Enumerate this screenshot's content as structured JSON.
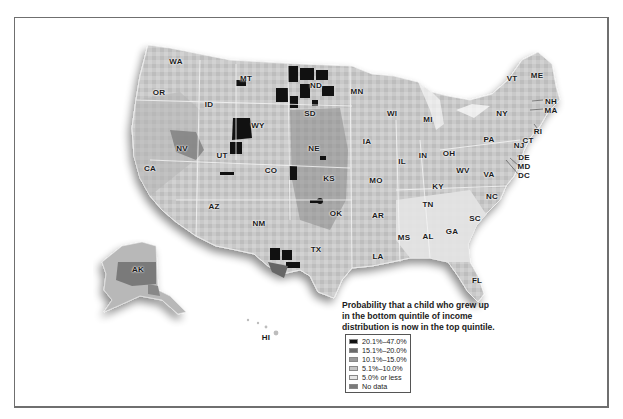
{
  "chart_data": {
    "type": "choropleth-map",
    "title": "Probability that a child who grew up in the bottom quintile of income distribution is now in the top quintile.",
    "legend": [
      {
        "label": "20.1%–47.0%",
        "color": "#111111"
      },
      {
        "label": "15.1%–20.0%",
        "color": "#6b6b6b"
      },
      {
        "label": "10.1%–15.0%",
        "color": "#9a9a9a"
      },
      {
        "label": "5.1%–10.0%",
        "color": "#c4c4c4"
      },
      {
        "label": "5.0% or less",
        "color": "#e6e6e6"
      },
      {
        "label": "No data",
        "color": "#7a7a7a"
      }
    ],
    "states": [
      "WA",
      "OR",
      "CA",
      "NV",
      "ID",
      "MT",
      "WY",
      "UT",
      "CO",
      "AZ",
      "NM",
      "ND",
      "SD",
      "NE",
      "KS",
      "OK",
      "TX",
      "MN",
      "IA",
      "MO",
      "AR",
      "LA",
      "WI",
      "IL",
      "MI",
      "IN",
      "OH",
      "KY",
      "TN",
      "MS",
      "AL",
      "GA",
      "SC",
      "NC",
      "FL",
      "WV",
      "VA",
      "PA",
      "NY",
      "VT",
      "ME",
      "NH",
      "MA",
      "RI",
      "CT",
      "NJ",
      "DE",
      "MD",
      "DC",
      "AK",
      "HI"
    ],
    "highlights": {
      "highest_regions": [
        "ND",
        "SD",
        "MT (east)",
        "WY",
        "UT (north)",
        "NE",
        "KS",
        "OK",
        "TX (west)"
      ],
      "lowest_regions": [
        "Southeast: GA, SC, NC, AL, MS, TN"
      ]
    }
  },
  "map": {
    "caption_lines": [
      "Probability that a child who grew up",
      "in the bottom quintile of income",
      "distribution is now in the top quintile."
    ],
    "labels": [
      {
        "id": "WA",
        "x": 176,
        "y": 61
      },
      {
        "id": "OR",
        "x": 159,
        "y": 92
      },
      {
        "id": "CA",
        "x": 150,
        "y": 168
      },
      {
        "id": "NV",
        "x": 182,
        "y": 148
      },
      {
        "id": "ID",
        "x": 209,
        "y": 104
      },
      {
        "id": "MT",
        "x": 246,
        "y": 78
      },
      {
        "id": "WY",
        "x": 258,
        "y": 125
      },
      {
        "id": "UT",
        "x": 222,
        "y": 155
      },
      {
        "id": "CO",
        "x": 271,
        "y": 170
      },
      {
        "id": "AZ",
        "x": 214,
        "y": 206
      },
      {
        "id": "NM",
        "x": 259,
        "y": 223
      },
      {
        "id": "ND",
        "x": 316,
        "y": 85
      },
      {
        "id": "SD",
        "x": 310,
        "y": 113
      },
      {
        "id": "NE",
        "x": 314,
        "y": 148
      },
      {
        "id": "KS",
        "x": 329,
        "y": 178
      },
      {
        "id": "OK",
        "x": 336,
        "y": 213
      },
      {
        "id": "TX",
        "x": 316,
        "y": 249
      },
      {
        "id": "MN",
        "x": 357,
        "y": 91
      },
      {
        "id": "IA",
        "x": 367,
        "y": 141
      },
      {
        "id": "MO",
        "x": 376,
        "y": 180
      },
      {
        "id": "AR",
        "x": 378,
        "y": 215
      },
      {
        "id": "LA",
        "x": 378,
        "y": 256
      },
      {
        "id": "WI",
        "x": 392,
        "y": 113
      },
      {
        "id": "IL",
        "x": 402,
        "y": 161
      },
      {
        "id": "MI",
        "x": 428,
        "y": 119
      },
      {
        "id": "IN",
        "x": 423,
        "y": 155
      },
      {
        "id": "OH",
        "x": 449,
        "y": 153
      },
      {
        "id": "KY",
        "x": 438,
        "y": 186
      },
      {
        "id": "TN",
        "x": 428,
        "y": 204
      },
      {
        "id": "MS",
        "x": 404,
        "y": 237
      },
      {
        "id": "AL",
        "x": 428,
        "y": 236
      },
      {
        "id": "GA",
        "x": 452,
        "y": 231
      },
      {
        "id": "SC",
        "x": 475,
        "y": 218
      },
      {
        "id": "NC",
        "x": 492,
        "y": 196
      },
      {
        "id": "FL",
        "x": 477,
        "y": 280
      },
      {
        "id": "WV",
        "x": 463,
        "y": 170
      },
      {
        "id": "VA",
        "x": 489,
        "y": 174
      },
      {
        "id": "PA",
        "x": 489,
        "y": 139
      },
      {
        "id": "NY",
        "x": 502,
        "y": 113
      },
      {
        "id": "VT",
        "x": 512,
        "y": 78
      },
      {
        "id": "ME",
        "x": 537,
        "y": 75
      },
      {
        "id": "NH",
        "x": 551,
        "y": 101
      },
      {
        "id": "MA",
        "x": 551,
        "y": 110
      },
      {
        "id": "RI",
        "x": 538,
        "y": 131
      },
      {
        "id": "CT",
        "x": 528,
        "y": 140
      },
      {
        "id": "NJ",
        "x": 519,
        "y": 145
      },
      {
        "id": "DE",
        "x": 524,
        "y": 157
      },
      {
        "id": "MD",
        "x": 524,
        "y": 166
      },
      {
        "id": "DC",
        "x": 524,
        "y": 175
      },
      {
        "id": "AK",
        "x": 138,
        "y": 269
      },
      {
        "id": "HI",
        "x": 266,
        "y": 337
      }
    ]
  }
}
